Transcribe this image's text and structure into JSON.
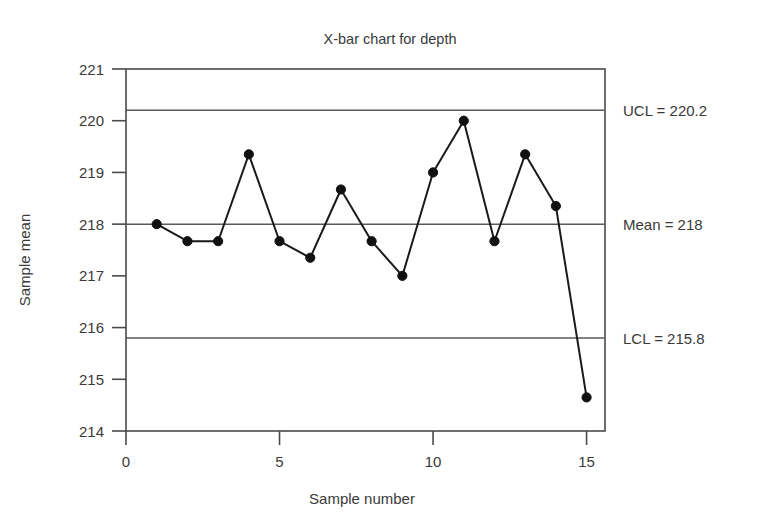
{
  "chart_data": {
    "type": "line",
    "title": "X-bar chart for depth",
    "xlabel": "Sample number",
    "ylabel": "Sample mean",
    "x": [
      1,
      2,
      3,
      4,
      5,
      6,
      7,
      8,
      9,
      10,
      11,
      12,
      13,
      14,
      15
    ],
    "values": [
      218.0,
      217.67,
      217.67,
      219.35,
      217.67,
      217.35,
      218.67,
      217.67,
      217.0,
      219.0,
      220.0,
      217.67,
      219.35,
      218.35,
      214.65
    ],
    "series": [
      {
        "name": "Sample mean",
        "values": [
          218.0,
          217.67,
          217.67,
          219.35,
          217.67,
          217.35,
          218.67,
          217.67,
          217.0,
          219.0,
          220.0,
          217.67,
          219.35,
          218.35,
          214.65
        ]
      }
    ],
    "xlim": [
      0,
      15.6
    ],
    "ylim": [
      214,
      221
    ],
    "xticks": [
      0,
      5,
      10,
      15
    ],
    "xtick_labels": [
      "0",
      "5",
      "10",
      "15"
    ],
    "yticks": [
      214,
      215,
      216,
      217,
      218,
      219,
      220,
      221
    ],
    "ytick_labels": [
      "214",
      "215",
      "216",
      "217",
      "218",
      "219",
      "220",
      "221"
    ],
    "grid": false,
    "legend": "none",
    "marker": "filled-circle",
    "control_limits": [
      {
        "id": "ucl",
        "label": "UCL = 220.2",
        "value": 220.2
      },
      {
        "id": "mean",
        "label": "Mean = 218",
        "value": 218.0
      },
      {
        "id": "lcl",
        "label": "LCL = 215.8",
        "value": 215.8
      }
    ],
    "colors": {
      "series_line": "#1a1a1a",
      "marker": "#111111",
      "limit_line": "#5a5a5a",
      "axis": "#4a4a4a",
      "text": "#3a3a3a",
      "background": "#ffffff"
    }
  }
}
